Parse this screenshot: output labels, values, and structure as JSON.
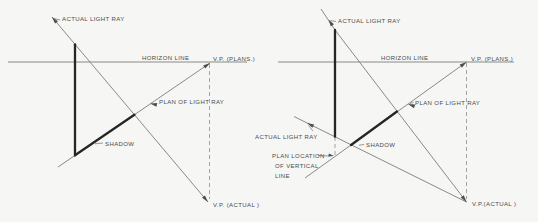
{
  "figure": {
    "background_color": "#f6f6f4",
    "colors": {
      "thin_line": "#7d7d7d",
      "thick_line": "#262626",
      "dashed_line": "#9a9a9a",
      "text": "#4a4a4a"
    },
    "left_diagram": {
      "labels": {
        "actual_light_ray": "ACTUAL LIGHT RAY",
        "horizon_line": "HORIZON LINE",
        "vp_plans": "V.P. (PLANS.)",
        "plan_of_light_ray": "PLAN OF LIGHT RAY",
        "shadow": "SHADOW",
        "vp_actual": "V.P. (ACTUAL )"
      }
    },
    "right_diagram": {
      "labels": {
        "actual_light_ray_top": "ACTUAL LIGHT RAY",
        "actual_light_ray_left": "ACTUAL LIGHT RAY",
        "horizon_line": "HORIZON LINE",
        "vp_plans": "V.P. (PLANS.)",
        "plan_of_light_ray": "PLAN OF LIGHT RAY",
        "shadow": "SHADOW",
        "plan_location_line1": "PLAN LOCATION",
        "plan_location_line2": "OF VERTICAL",
        "plan_location_line3": "LINE",
        "vp_actual": "V.P.(ACTUAL )"
      }
    }
  }
}
